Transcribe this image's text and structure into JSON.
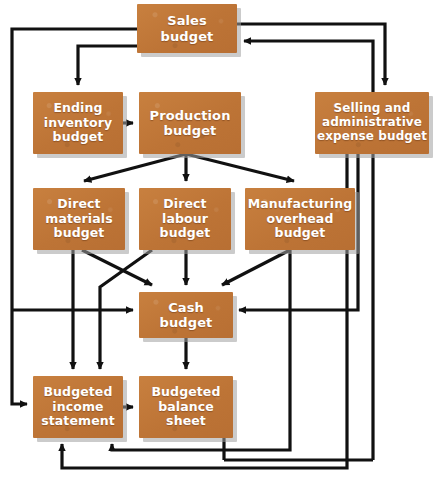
{
  "diagram": {
    "box_fill": "#c47a3d",
    "box_text_color": "#ffffff",
    "connector_color": "#111111",
    "background": "#ffffff",
    "nodes": [
      {
        "id": "sales",
        "label": "Sales budget",
        "lines": [
          "Sales",
          "budget"
        ]
      },
      {
        "id": "ending",
        "label": "Ending inventory budget",
        "lines": [
          "Ending",
          "inventory",
          "budget"
        ]
      },
      {
        "id": "production",
        "label": "Production budget",
        "lines": [
          "Production",
          "budget"
        ]
      },
      {
        "id": "selling",
        "label": "Selling and administrative expense budget",
        "lines": [
          "Selling and",
          "administrative",
          "expense budget"
        ]
      },
      {
        "id": "materials",
        "label": "Direct materials budget",
        "lines": [
          "Direct",
          "materials",
          "budget"
        ]
      },
      {
        "id": "labour",
        "label": "Direct labour budget",
        "lines": [
          "Direct",
          "labour",
          "budget"
        ]
      },
      {
        "id": "overhead",
        "label": "Manufacturing overhead budget",
        "lines": [
          "Manufacturing",
          "overhead",
          "budget"
        ]
      },
      {
        "id": "cash",
        "label": "Cash budget",
        "lines": [
          "Cash",
          "budget"
        ]
      },
      {
        "id": "bis",
        "label": "Budgeted income statement",
        "lines": [
          "Budgeted",
          "income",
          "statement"
        ]
      },
      {
        "id": "bbs",
        "label": "Budgeted balance sheet",
        "lines": [
          "Budgeted",
          "balance",
          "sheet"
        ]
      }
    ],
    "edges": [
      {
        "from": "sales",
        "to": "selling"
      },
      {
        "from": "sales",
        "to": "ending"
      },
      {
        "from": "sales",
        "to": "cash"
      },
      {
        "from": "sales",
        "to": "bis"
      },
      {
        "from": "ending",
        "to": "production"
      },
      {
        "from": "production",
        "to": "materials"
      },
      {
        "from": "production",
        "to": "labour"
      },
      {
        "from": "production",
        "to": "overhead"
      },
      {
        "from": "materials",
        "to": "cash"
      },
      {
        "from": "materials",
        "to": "bis"
      },
      {
        "from": "labour",
        "to": "cash"
      },
      {
        "from": "labour",
        "to": "bis"
      },
      {
        "from": "overhead",
        "to": "cash"
      },
      {
        "from": "overhead",
        "to": "bis"
      },
      {
        "from": "selling",
        "to": "cash"
      },
      {
        "from": "selling",
        "to": "bis"
      },
      {
        "from": "cash",
        "to": "bbs"
      },
      {
        "from": "cash",
        "to": "bis"
      },
      {
        "from": "bis",
        "to": "bbs"
      },
      {
        "from": "bbs",
        "to": "sales"
      }
    ]
  }
}
